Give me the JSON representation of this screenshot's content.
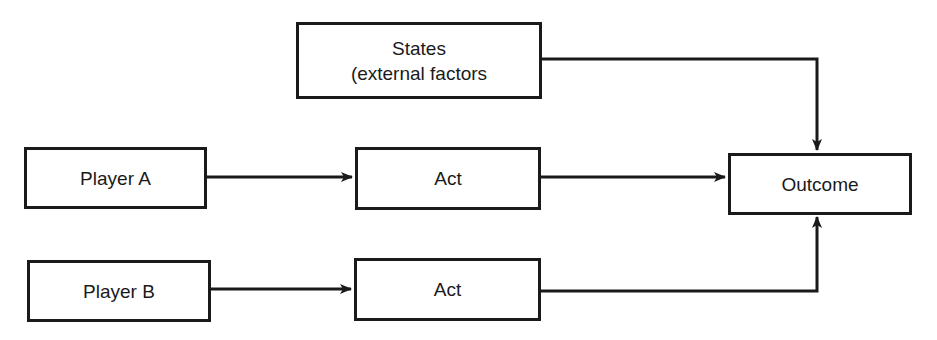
{
  "diagram": {
    "nodes": {
      "states": {
        "line1": "States",
        "line2": "(external factors"
      },
      "player_a": {
        "label": "Player A"
      },
      "act_a": {
        "label": "Act"
      },
      "player_b": {
        "label": "Player B"
      },
      "act_b": {
        "label": "Act"
      },
      "outcome": {
        "label": "Outcome"
      }
    },
    "edges": [
      {
        "from": "player_a",
        "to": "act_a"
      },
      {
        "from": "act_a",
        "to": "outcome"
      },
      {
        "from": "player_b",
        "to": "act_b"
      },
      {
        "from": "act_b",
        "to": "outcome"
      },
      {
        "from": "states",
        "to": "outcome"
      }
    ],
    "colors": {
      "line": "#1a1a1a",
      "background": "#ffffff"
    }
  }
}
